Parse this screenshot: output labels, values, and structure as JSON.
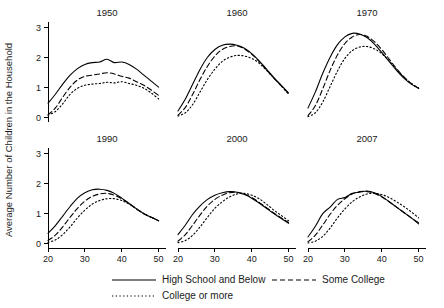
{
  "chart_data": {
    "type": "line",
    "title": "",
    "xlabel": "",
    "ylabel": "Average Number of Children in the Household",
    "xlim": [
      20,
      52
    ],
    "ylim": [
      -0.15,
      3.2
    ],
    "xticks": [
      20,
      30,
      40,
      50
    ],
    "yticks": [
      0,
      1,
      2,
      3
    ],
    "xtick_labels": [
      "20",
      "30",
      "40",
      "50"
    ],
    "ytick_labels": [
      "0",
      "1",
      "2",
      "3"
    ],
    "grid": false,
    "legend_position": "bottom",
    "legend": [
      {
        "name": "High School and Below",
        "style": "solid"
      },
      {
        "name": "Some College",
        "style": "dashed"
      },
      {
        "name": "College or more",
        "style": "dotted"
      }
    ],
    "panel_layout": {
      "rows": 2,
      "cols": 3
    },
    "panels": [
      {
        "title": "1950",
        "x": [
          20,
          22,
          24,
          26,
          28,
          30,
          32,
          34,
          36,
          38,
          40,
          42,
          44,
          46,
          48,
          50
        ],
        "series": [
          {
            "name": "High School and Below",
            "style": "solid",
            "values": [
              0.48,
              0.78,
              1.12,
              1.42,
              1.64,
              1.78,
              1.84,
              1.86,
              1.95,
              1.84,
              1.86,
              1.78,
              1.62,
              1.42,
              1.22,
              1.02
            ]
          },
          {
            "name": "Some College",
            "style": "dashed",
            "values": [
              0.09,
              0.32,
              0.68,
              1.02,
              1.26,
              1.38,
              1.42,
              1.46,
              1.5,
              1.46,
              1.38,
              1.32,
              1.2,
              1.08,
              0.92,
              0.74
            ]
          },
          {
            "name": "College or more",
            "style": "dotted",
            "values": [
              0.08,
              0.2,
              0.46,
              0.78,
              0.98,
              1.08,
              1.12,
              1.14,
              1.18,
              1.16,
              1.2,
              1.14,
              1.08,
              0.98,
              0.82,
              0.62
            ]
          }
        ]
      },
      {
        "title": "1960",
        "x": [
          20,
          22,
          24,
          26,
          28,
          30,
          32,
          34,
          36,
          38,
          40,
          42,
          44,
          46,
          48,
          50
        ],
        "series": [
          {
            "name": "High School and Below",
            "style": "solid",
            "values": [
              0.22,
              0.62,
              1.12,
              1.62,
              2.02,
              2.28,
              2.42,
              2.46,
              2.42,
              2.32,
              2.14,
              1.9,
              1.62,
              1.34,
              1.08,
              0.82
            ]
          },
          {
            "name": "Some College",
            "style": "dashed",
            "values": [
              0.08,
              0.34,
              0.78,
              1.28,
              1.72,
              2.06,
              2.28,
              2.38,
              2.4,
              2.3,
              2.12,
              1.88,
              1.6,
              1.32,
              1.06,
              0.8
            ]
          },
          {
            "name": "College or more",
            "style": "dotted",
            "values": [
              0.05,
              0.16,
              0.44,
              0.86,
              1.28,
              1.62,
              1.88,
              2.02,
              2.08,
              2.06,
              1.98,
              1.82,
              1.58,
              1.32,
              1.06,
              0.78
            ]
          }
        ]
      },
      {
        "title": "1970",
        "x": [
          20,
          22,
          24,
          26,
          28,
          30,
          32,
          34,
          36,
          38,
          40,
          42,
          44,
          46,
          48,
          50
        ],
        "series": [
          {
            "name": "High School and Below",
            "style": "solid",
            "values": [
              0.32,
              0.86,
              1.48,
              2.02,
              2.44,
              2.7,
              2.82,
              2.8,
              2.68,
              2.46,
              2.18,
              1.88,
              1.58,
              1.32,
              1.12,
              0.98
            ]
          },
          {
            "name": "Some College",
            "style": "dashed",
            "values": [
              0.06,
              0.4,
              0.96,
              1.58,
              2.1,
              2.48,
              2.7,
              2.78,
              2.72,
              2.54,
              2.28,
              1.96,
              1.64,
              1.36,
              1.14,
              0.98
            ]
          },
          {
            "name": "College or more",
            "style": "dotted",
            "values": [
              0.03,
              0.16,
              0.52,
              1.04,
              1.56,
              1.98,
              2.24,
              2.36,
              2.38,
              2.3,
              2.14,
              1.9,
              1.62,
              1.36,
              1.14,
              0.98
            ]
          }
        ]
      },
      {
        "title": "1990",
        "x": [
          20,
          22,
          24,
          26,
          28,
          30,
          32,
          34,
          36,
          38,
          40,
          42,
          44,
          46,
          48,
          50
        ],
        "series": [
          {
            "name": "High School and Below",
            "style": "solid",
            "values": [
              0.34,
              0.6,
              0.92,
              1.24,
              1.52,
              1.7,
              1.8,
              1.82,
              1.78,
              1.68,
              1.52,
              1.34,
              1.16,
              1.0,
              0.88,
              0.76
            ]
          },
          {
            "name": "Some College",
            "style": "dashed",
            "values": [
              0.1,
              0.28,
              0.56,
              0.88,
              1.18,
              1.42,
              1.58,
              1.66,
              1.68,
              1.62,
              1.5,
              1.34,
              1.16,
              1.0,
              0.88,
              0.76
            ]
          },
          {
            "name": "College or more",
            "style": "dotted",
            "values": [
              0.04,
              0.12,
              0.3,
              0.56,
              0.86,
              1.12,
              1.32,
              1.44,
              1.5,
              1.5,
              1.44,
              1.32,
              1.16,
              1.0,
              0.88,
              0.76
            ]
          }
        ]
      },
      {
        "title": "2000",
        "x": [
          20,
          22,
          24,
          26,
          28,
          30,
          32,
          34,
          36,
          38,
          40,
          42,
          44,
          46,
          48,
          50
        ],
        "series": [
          {
            "name": "High School and Below",
            "style": "solid",
            "values": [
              0.3,
              0.62,
              0.98,
              1.26,
              1.48,
              1.62,
              1.7,
              1.74,
              1.72,
              1.64,
              1.52,
              1.36,
              1.18,
              1.0,
              0.84,
              0.68
            ]
          },
          {
            "name": "Some College",
            "style": "dashed",
            "values": [
              0.08,
              0.3,
              0.62,
              0.96,
              1.26,
              1.48,
              1.62,
              1.7,
              1.72,
              1.66,
              1.54,
              1.38,
              1.2,
              1.02,
              0.86,
              0.7
            ]
          },
          {
            "name": "College or more",
            "style": "dotted",
            "values": [
              0.03,
              0.1,
              0.28,
              0.56,
              0.88,
              1.18,
              1.4,
              1.56,
              1.66,
              1.68,
              1.62,
              1.5,
              1.32,
              1.12,
              0.94,
              0.76
            ]
          }
        ]
      },
      {
        "title": "2007",
        "x": [
          20,
          22,
          24,
          26,
          28,
          30,
          32,
          34,
          36,
          38,
          40,
          42,
          44,
          46,
          48,
          50
        ],
        "series": [
          {
            "name": "High School and Below",
            "style": "solid",
            "values": [
              0.22,
              0.58,
              1.0,
              1.22,
              1.48,
              1.54,
              1.68,
              1.72,
              1.76,
              1.7,
              1.58,
              1.4,
              1.22,
              1.04,
              0.86,
              0.66
            ]
          },
          {
            "name": "Some College",
            "style": "dashed",
            "values": [
              0.06,
              0.28,
              0.62,
              0.98,
              1.28,
              1.5,
              1.66,
              1.74,
              1.74,
              1.68,
              1.56,
              1.4,
              1.22,
              1.04,
              0.86,
              0.7
            ]
          },
          {
            "name": "College or more",
            "style": "dotted",
            "values": [
              0.02,
              0.08,
              0.24,
              0.52,
              0.86,
              1.16,
              1.4,
              1.56,
              1.66,
              1.68,
              1.64,
              1.54,
              1.4,
              1.24,
              1.06,
              0.86
            ]
          }
        ]
      }
    ]
  }
}
